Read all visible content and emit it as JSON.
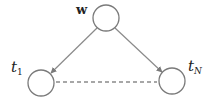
{
  "diagram": {
    "type": "graphical-model",
    "nodes": [
      {
        "id": "w",
        "label": "w",
        "style": "bold",
        "cx": 106,
        "cy": 18,
        "r": 13
      },
      {
        "id": "t1",
        "label": "t",
        "subscript": "1",
        "style": "italic",
        "cx": 41,
        "cy": 83,
        "r": 13
      },
      {
        "id": "tN",
        "label": "t",
        "subscript": "N",
        "style": "italic",
        "cx": 172,
        "cy": 81,
        "r": 13
      }
    ],
    "edges": [
      {
        "from": "w",
        "to": "t1",
        "kind": "directed"
      },
      {
        "from": "w",
        "to": "tN",
        "kind": "directed"
      },
      {
        "from": "t1",
        "to": "tN",
        "kind": "dashed-undirected"
      }
    ],
    "colors": {
      "stroke": "#7a7a7a",
      "text": "#222222",
      "background": "#ffffff"
    }
  }
}
